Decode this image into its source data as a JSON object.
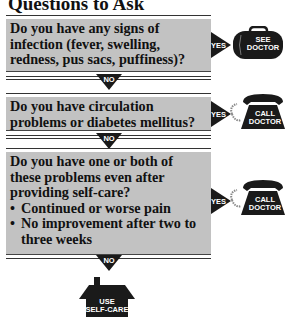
{
  "title": "Questions to Ask",
  "questions": [
    {
      "text": "Do you have any signs of infection (fever, swelling, redness, pus sacs, puffiness)?",
      "yes_label": "YES",
      "yes_action": {
        "icon": "doctor-bag-icon",
        "line1": "SEE",
        "line2": "DOCTOR"
      },
      "no_label": "NO"
    },
    {
      "text": "Do you have circulation problems or diabetes mellitus?",
      "yes_label": "YES",
      "yes_action": {
        "icon": "telephone-icon",
        "line1": "CALL",
        "line2": "DOCTOR"
      },
      "no_label": "NO"
    },
    {
      "text": "Do you have one or both of these problems even after providing self-care?",
      "bullets": [
        "Continued or worse pain",
        "No improvement after two to three weeks"
      ],
      "yes_label": "YES",
      "yes_action": {
        "icon": "telephone-icon",
        "line1": "CALL",
        "line2": "DOCTOR"
      },
      "no_label": "NO"
    }
  ],
  "final_action": {
    "icon": "house-icon",
    "line1": "USE",
    "line2": "SELF-CARE"
  },
  "colors": {
    "box_fill": "#c2c2c2",
    "icon_fill": "#1a1a1a",
    "text": "#111111"
  }
}
